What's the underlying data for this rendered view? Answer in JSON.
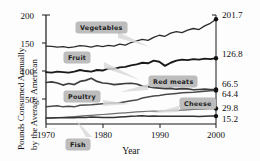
{
  "chart_data": {
    "type": "line",
    "title": "",
    "xlabel": "Year",
    "ylabel": "Pounds Consumed Annually by the Average American",
    "ylabel_line1": "Pounds Consumed Annually",
    "ylabel_line2": "by the Average American",
    "xlim": [
      1970,
      2000
    ],
    "ylim": [
      0,
      210
    ],
    "xticks": [
      "1970",
      "1980",
      "1990",
      "2000"
    ],
    "yticks": [
      "200",
      "150",
      "100",
      "50"
    ],
    "grid": false,
    "legend_position": "inline-callouts",
    "series": [
      {
        "name": "Vegetables",
        "end_value": "201.7",
        "color": "#2b2b2b",
        "x": [
          1970,
          1971,
          1972,
          1973,
          1974,
          1975,
          1976,
          1977,
          1978,
          1979,
          1980,
          1981,
          1982,
          1983,
          1984,
          1985,
          1986,
          1987,
          1988,
          1989,
          1990,
          1991,
          1992,
          1993,
          1994,
          1995,
          1996,
          1997,
          1998,
          1999,
          2000
        ],
        "values": [
          150.0,
          149.5,
          148.0,
          149.0,
          147.0,
          148.5,
          151.0,
          150.0,
          148.0,
          151.0,
          149.0,
          151.5,
          150.0,
          154.0,
          152.0,
          157.0,
          160.0,
          163.0,
          161.0,
          167.0,
          171.0,
          169.0,
          175.0,
          178.0,
          176.0,
          181.0,
          184.0,
          182.0,
          189.0,
          194.0,
          201.7
        ]
      },
      {
        "name": "Fruit",
        "end_value": "126.8",
        "color": "#1a1a1a",
        "x": [
          1970,
          1971,
          1972,
          1973,
          1974,
          1975,
          1976,
          1977,
          1978,
          1979,
          1980,
          1981,
          1982,
          1983,
          1984,
          1985,
          1986,
          1987,
          1988,
          1989,
          1990,
          1991,
          1992,
          1993,
          1994,
          1995,
          1996,
          1997,
          1998,
          1999,
          2000
        ],
        "values": [
          100.0,
          99.0,
          101.0,
          100.0,
          99.0,
          101.0,
          104.0,
          102.0,
          101.0,
          104.0,
          103.0,
          107.0,
          106.0,
          109.0,
          110.0,
          113.0,
          115.0,
          118.0,
          117.0,
          122.0,
          120.0,
          112.0,
          118.0,
          122.0,
          124.0,
          123.0,
          125.0,
          124.0,
          126.0,
          125.0,
          126.8
        ]
      },
      {
        "name": "Red meats",
        "end_value": "66.5",
        "color": "#3d3d3d",
        "x": [
          1970,
          1971,
          1972,
          1973,
          1974,
          1975,
          1976,
          1977,
          1978,
          1979,
          1980,
          1981,
          1982,
          1983,
          1984,
          1985,
          1986,
          1987,
          1988,
          1989,
          1990,
          1991,
          1992,
          1993,
          1994,
          1995,
          1996,
          1997,
          1998,
          1999,
          2000
        ],
        "values": [
          80.0,
          81.0,
          79.0,
          75.0,
          78.0,
          76.0,
          82.0,
          84.0,
          88.0,
          82.0,
          79.0,
          78.0,
          76.0,
          77.0,
          78.0,
          78.5,
          77.0,
          73.0,
          72.0,
          70.0,
          69.0,
          68.0,
          68.5,
          67.0,
          68.0,
          67.5,
          66.0,
          66.5,
          67.0,
          66.5,
          66.5
        ]
      },
      {
        "name": "Poultry",
        "end_value": "64.4",
        "color": "#4a4a4a",
        "x": [
          1970,
          1971,
          1972,
          1973,
          1974,
          1975,
          1976,
          1977,
          1978,
          1979,
          1980,
          1981,
          1982,
          1983,
          1984,
          1985,
          1986,
          1987,
          1988,
          1989,
          1990,
          1991,
          1992,
          1993,
          1994,
          1995,
          1996,
          1997,
          1998,
          1999,
          2000
        ],
        "values": [
          33.0,
          34.0,
          35.0,
          33.0,
          34.0,
          33.0,
          36.0,
          36.5,
          37.0,
          38.0,
          39.0,
          40.0,
          40.5,
          41.0,
          43.0,
          45.0,
          46.0,
          50.0,
          52.0,
          54.0,
          55.0,
          57.0,
          58.0,
          59.0,
          60.0,
          60.5,
          61.0,
          62.0,
          63.0,
          64.0,
          64.4
        ]
      },
      {
        "name": "Cheese",
        "end_value": "29.8",
        "color": "#6e6e6e",
        "x": [
          1970,
          1971,
          1972,
          1973,
          1974,
          1975,
          1976,
          1977,
          1978,
          1979,
          1980,
          1981,
          1982,
          1983,
          1984,
          1985,
          1986,
          1987,
          1988,
          1989,
          1990,
          1991,
          1992,
          1993,
          1994,
          1995,
          1996,
          1997,
          1998,
          1999,
          2000
        ],
        "values": [
          11.0,
          11.7,
          12.4,
          13.0,
          13.6,
          14.3,
          15.2,
          16.0,
          16.8,
          17.6,
          18.3,
          19.2,
          20.0,
          20.8,
          21.5,
          22.4,
          23.2,
          24.0,
          24.6,
          25.0,
          24.6,
          25.2,
          26.0,
          26.3,
          26.8,
          27.3,
          27.9,
          28.4,
          28.9,
          29.4,
          29.8
        ]
      },
      {
        "name": "Fish",
        "end_value": "15.2",
        "color": "#333333",
        "x": [
          1970,
          1971,
          1972,
          1973,
          1974,
          1975,
          1976,
          1977,
          1978,
          1979,
          1980,
          1981,
          1982,
          1983,
          1984,
          1985,
          1986,
          1987,
          1988,
          1989,
          1990,
          1991,
          1992,
          1993,
          1994,
          1995,
          1996,
          1997,
          1998,
          1999,
          2000
        ],
        "values": [
          11.8,
          11.5,
          12.0,
          12.2,
          12.1,
          12.2,
          12.9,
          12.7,
          13.4,
          13.0,
          12.4,
          12.6,
          12.3,
          13.3,
          14.1,
          15.0,
          15.4,
          16.1,
          15.1,
          15.6,
          15.0,
          14.8,
          14.7,
          14.9,
          15.1,
          14.9,
          14.7,
          14.5,
          14.8,
          15.2,
          15.2
        ]
      }
    ],
    "callouts": [
      {
        "label": "Vegetables"
      },
      {
        "label": "Fruit"
      },
      {
        "label": "Poultry"
      },
      {
        "label": "Red meats"
      },
      {
        "label": "Cheese"
      },
      {
        "label": "Fish"
      }
    ]
  }
}
